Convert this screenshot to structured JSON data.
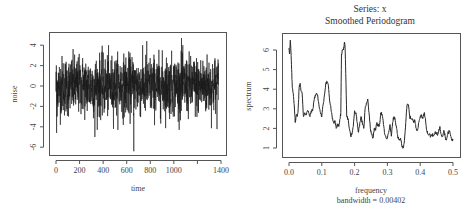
{
  "chart_data": [
    {
      "type": "line",
      "title": "",
      "xlabel": "time",
      "ylabel": "noise",
      "xlim": [
        0,
        1400
      ],
      "ylim": [
        -6.5,
        4.8
      ],
      "xticks": [
        0,
        200,
        400,
        600,
        800,
        1000,
        1200,
        1400
      ],
      "xtick_labels": [
        "0",
        "200",
        "400",
        "600",
        "800",
        "1000",
        "",
        "1400"
      ],
      "yticks": [
        -6,
        -4,
        -2,
        0,
        2,
        4
      ],
      "ytick_labels": [
        "-6",
        "-4",
        "-2",
        "0",
        "2",
        "4"
      ],
      "n_points": 1380,
      "series_description": "white noise series, mean ~0, sd ~1.5, range approx -6.4 to 4.7",
      "extremes": [
        {
          "x": 660,
          "y": -6.4
        },
        {
          "x": 1065,
          "y": 4.7
        },
        {
          "x": 770,
          "y": 4.4
        },
        {
          "x": 330,
          "y": -5.0
        },
        {
          "x": 5,
          "y": -4.6
        }
      ],
      "grid": false
    },
    {
      "type": "line",
      "title": "Series: x",
      "subtitle": "Smoothed Periodogram",
      "xlabel": "frequency",
      "xlabel_note": "bandwidth = 0.00402",
      "ylabel": "spectrum",
      "xlim": [
        0,
        0.5
      ],
      "ylim": [
        0.85,
        6.7
      ],
      "xticks": [
        0.0,
        0.1,
        0.2,
        0.3,
        0.4,
        0.5
      ],
      "xtick_labels": [
        "0.0",
        "0.1",
        "0.2",
        "0.3",
        "0.4",
        "0.5"
      ],
      "yticks": [
        1,
        2,
        3,
        4,
        5,
        6
      ],
      "ytick_labels": [
        "1",
        "2",
        "3",
        "4",
        "5",
        "6"
      ],
      "x": [
        0.0,
        0.002,
        0.004,
        0.006,
        0.008,
        0.01,
        0.013,
        0.016,
        0.019,
        0.022,
        0.025,
        0.028,
        0.031,
        0.034,
        0.037,
        0.04,
        0.044,
        0.048,
        0.052,
        0.056,
        0.06,
        0.064,
        0.068,
        0.072,
        0.076,
        0.08,
        0.084,
        0.088,
        0.092,
        0.096,
        0.1,
        0.104,
        0.108,
        0.112,
        0.116,
        0.12,
        0.124,
        0.128,
        0.132,
        0.136,
        0.14,
        0.144,
        0.148,
        0.152,
        0.156,
        0.158,
        0.16,
        0.163,
        0.166,
        0.169,
        0.171,
        0.173,
        0.176,
        0.18,
        0.184,
        0.188,
        0.192,
        0.196,
        0.2,
        0.204,
        0.208,
        0.212,
        0.216,
        0.22,
        0.224,
        0.228,
        0.232,
        0.236,
        0.24,
        0.244,
        0.248,
        0.252,
        0.256,
        0.26,
        0.264,
        0.268,
        0.272,
        0.276,
        0.28,
        0.284,
        0.288,
        0.292,
        0.296,
        0.3,
        0.304,
        0.308,
        0.312,
        0.316,
        0.32,
        0.324,
        0.328,
        0.332,
        0.336,
        0.34,
        0.344,
        0.348,
        0.352,
        0.356,
        0.36,
        0.364,
        0.368,
        0.372,
        0.376,
        0.38,
        0.384,
        0.388,
        0.392,
        0.396,
        0.4,
        0.404,
        0.408,
        0.412,
        0.416,
        0.42,
        0.424,
        0.428,
        0.432,
        0.436,
        0.44,
        0.444,
        0.448,
        0.452,
        0.456,
        0.46,
        0.464,
        0.468,
        0.472,
        0.476,
        0.48,
        0.484,
        0.488,
        0.492,
        0.496,
        0.5
      ],
      "y": [
        6.1,
        5.8,
        6.5,
        5.9,
        5.0,
        4.1,
        3.8,
        3.2,
        2.3,
        2.7,
        2.6,
        3.0,
        4.1,
        4.3,
        3.9,
        3.8,
        2.6,
        2.8,
        2.7,
        2.9,
        2.8,
        2.6,
        2.9,
        2.9,
        3.4,
        3.7,
        3.8,
        3.6,
        3.1,
        2.8,
        2.6,
        3.2,
        3.7,
        4.3,
        4.4,
        4.2,
        3.4,
        3.0,
        2.5,
        2.3,
        2.4,
        2.0,
        2.2,
        2.1,
        2.5,
        2.8,
        5.8,
        6.0,
        6.0,
        6.4,
        6.1,
        4.8,
        2.6,
        2.5,
        2.0,
        1.6,
        1.7,
        2.1,
        2.9,
        2.8,
        2.3,
        1.8,
        2.3,
        2.6,
        2.2,
        2.0,
        3.0,
        3.3,
        3.5,
        2.8,
        2.0,
        1.7,
        1.5,
        2.0,
        1.9,
        2.3,
        2.1,
        2.2,
        2.8,
        2.7,
        2.2,
        1.7,
        1.5,
        1.5,
        1.8,
        2.2,
        1.6,
        2.3,
        2.6,
        2.4,
        2.0,
        1.5,
        1.4,
        1.5,
        1.1,
        1.0,
        1.4,
        2.3,
        3.2,
        3.2,
        2.6,
        2.5,
        2.5,
        2.3,
        2.4,
        2.0,
        1.9,
        2.3,
        2.6,
        2.7,
        2.5,
        2.8,
        2.5,
        1.9,
        1.7,
        1.7,
        1.6,
        1.7,
        1.6,
        1.7,
        1.8,
        1.7,
        1.8,
        2.1,
        1.7,
        1.6,
        1.9,
        1.6,
        1.4,
        1.7,
        1.9,
        1.7,
        1.4,
        1.4
      ],
      "grid": false
    }
  ]
}
